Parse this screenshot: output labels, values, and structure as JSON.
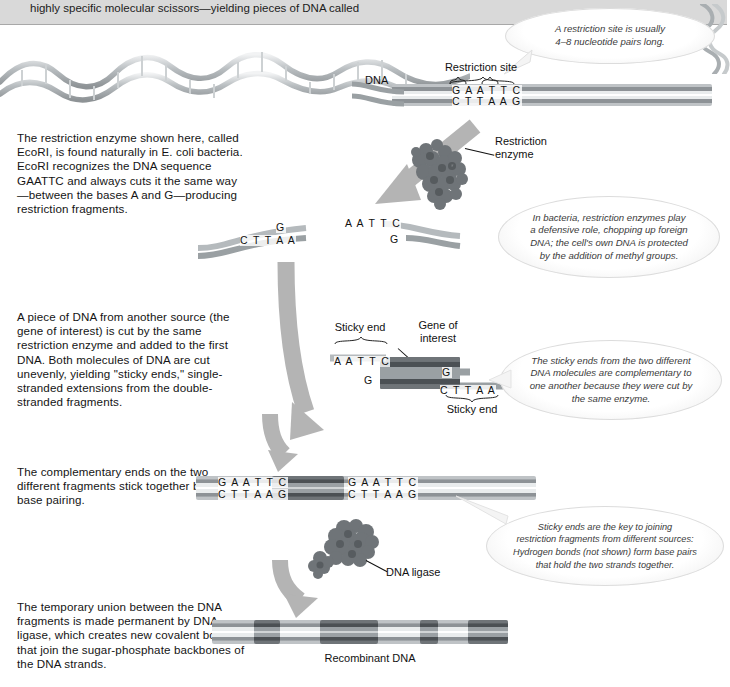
{
  "figure": {
    "top_cut_text": "highly specific molecular scissors—yielding pieces of DNA called"
  },
  "labels": {
    "dna": "DNA",
    "restriction_site": "Restriction site",
    "restriction_enzyme": "Restriction\nenzyme",
    "sticky_end_top": "Sticky end",
    "sticky_end_bottom": "Sticky end",
    "gene_of_interest": "Gene of\ninterest",
    "dna_ligase": "DNA ligase",
    "recombinant_dna": "Recombinant DNA"
  },
  "sequences": {
    "site_top": "G A A T T C",
    "site_bottom": "C T T A A G",
    "cut_left_top": "G",
    "cut_left_bottom": "C T T A A",
    "cut_right_top": "A A T T C",
    "cut_right_bottom": "G",
    "gene_left_top": "A A T T C",
    "gene_left_bottom": "G",
    "gene_right_top": "G",
    "gene_right_bottom": "C T T A A",
    "joined_left_top": "G A A T T C",
    "joined_left_bottom": "C T T A A G",
    "joined_right_top": "G A A T T C",
    "joined_right_bottom": "C T T A A G"
  },
  "steps": [
    {
      "id": "step-1",
      "text": "The restriction enzyme shown here, called EcoRI, is found naturally in E. coli bacteria. EcoRI recognizes the DNA sequence GAATTC and always cuts it the same way—between the bases A and G—producing restriction fragments."
    },
    {
      "id": "step-2",
      "text": "A piece of DNA from another source (the gene of interest) is cut by the same restriction enzyme and added to the first DNA. Both molecules of DNA are cut unevenly, yielding \"sticky ends,\" single-stranded extensions from the double-stranded fragments."
    },
    {
      "id": "step-3",
      "text": "The complementary ends on the two different fragments stick together by base pairing."
    },
    {
      "id": "step-4",
      "text": "The temporary union between the DNA fragments is made permanent by DNA ligase, which creates new covalent bonds that join the sugar-phosphate backbones of the DNA strands."
    }
  ],
  "callouts": [
    {
      "id": "callout-restriction-site",
      "lines": [
        "A restriction site is usually",
        "4–8 nucleotide pairs long."
      ]
    },
    {
      "id": "callout-bacteria-defense",
      "lines": [
        "In bacteria, restriction enzymes play",
        "a defensive role, chopping up foreign",
        "DNA; the cell's own DNA is protected",
        "by the addition of methyl groups."
      ]
    },
    {
      "id": "callout-sticky-ends-complementary",
      "lines": [
        "The sticky ends from the two different",
        "DNA molecules are complementary to",
        "one another because they were cut by",
        "the same enzyme."
      ]
    },
    {
      "id": "callout-sticky-ends-key",
      "lines": [
        "Sticky ends are the key to joining",
        "restriction fragments from different sources:",
        "Hydrogen bonds (not shown) form base pairs",
        "that hold the two strands together."
      ]
    }
  ],
  "colors": {
    "page_background": "#ffffff",
    "top_strip": "#d9d9d9",
    "arrow_gray": "#b4b4b4",
    "dna_gray": "#8d9296",
    "gene_dark": "#4b5054",
    "text": "#141414",
    "callout_text": "#3a3a3a"
  }
}
